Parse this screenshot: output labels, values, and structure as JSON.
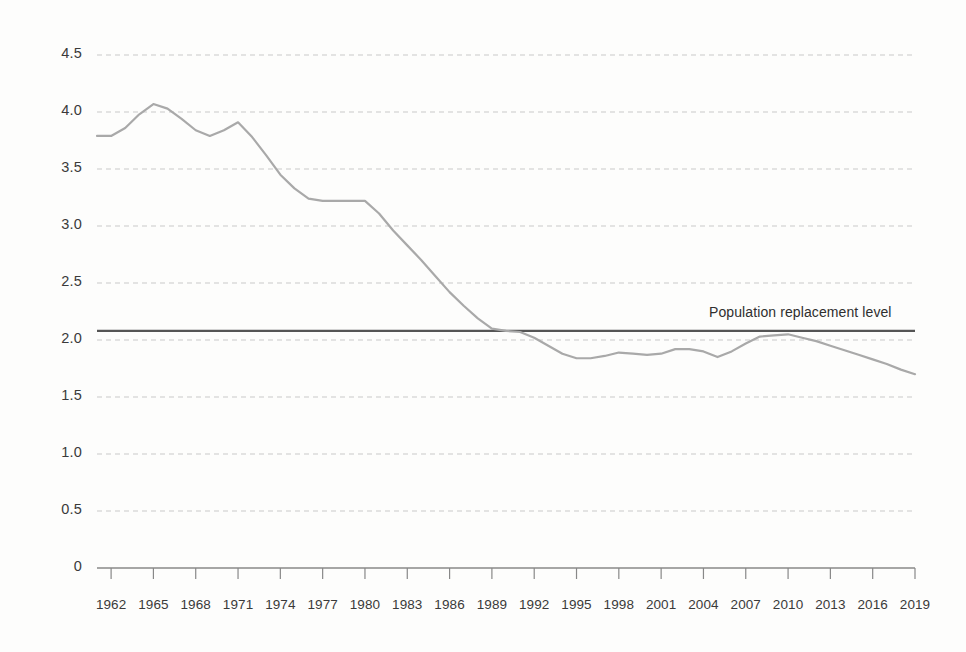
{
  "chart_data": {
    "type": "line",
    "title": "",
    "subtitle": "",
    "xlabel": "",
    "ylabel": "",
    "xlim": [
      1961,
      2019
    ],
    "ylim": [
      0,
      4.5
    ],
    "grid": "horizontal-dashed",
    "legend": "none",
    "y_ticks": [
      "4.5",
      "4.0",
      "3.5",
      "3.0",
      "2.5",
      "2.0",
      "1.5",
      "1.0",
      "0.5",
      "0"
    ],
    "y_tick_values": [
      4.5,
      4.0,
      3.5,
      3.0,
      2.5,
      2.0,
      1.5,
      1.0,
      0.5,
      0
    ],
    "x_ticks": [
      "1962",
      "1965",
      "1968",
      "1971",
      "1974",
      "1977",
      "1980",
      "1983",
      "1986",
      "1989",
      "1992",
      "1995",
      "1998",
      "2001",
      "2004",
      "2007",
      "2010",
      "2013",
      "2016",
      "2019"
    ],
    "x_tick_values": [
      1962,
      1965,
      1968,
      1971,
      1974,
      1977,
      1980,
      1983,
      1986,
      1989,
      1992,
      1995,
      1998,
      2001,
      2004,
      2007,
      2010,
      2013,
      2016,
      2019
    ],
    "series": [
      {
        "name": "Fertility rate",
        "color": "#a9a9a9",
        "x": [
          1961,
          1962,
          1963,
          1964,
          1965,
          1966,
          1967,
          1968,
          1969,
          1970,
          1971,
          1972,
          1973,
          1974,
          1975,
          1976,
          1977,
          1978,
          1979,
          1980,
          1981,
          1982,
          1983,
          1984,
          1985,
          1986,
          1987,
          1988,
          1989,
          1990,
          1991,
          1992,
          1993,
          1994,
          1995,
          1996,
          1997,
          1998,
          1999,
          2000,
          2001,
          2002,
          2003,
          2004,
          2005,
          2006,
          2007,
          2008,
          2009,
          2010,
          2011,
          2012,
          2013,
          2014,
          2015,
          2016,
          2017,
          2018,
          2019
        ],
        "values": [
          3.79,
          3.79,
          3.86,
          3.98,
          4.07,
          4.03,
          3.94,
          3.84,
          3.79,
          3.84,
          3.91,
          3.78,
          3.62,
          3.45,
          3.33,
          3.24,
          3.22,
          3.22,
          3.22,
          3.22,
          3.11,
          2.96,
          2.83,
          2.7,
          2.56,
          2.42,
          2.3,
          2.19,
          2.1,
          2.08,
          2.07,
          2.02,
          1.95,
          1.88,
          1.84,
          1.84,
          1.86,
          1.89,
          1.88,
          1.87,
          1.88,
          1.92,
          1.92,
          1.9,
          1.85,
          1.9,
          1.97,
          2.03,
          2.04,
          2.05,
          2.02,
          1.99,
          1.95,
          1.91,
          1.87,
          1.83,
          1.79,
          1.74,
          1.7
        ]
      }
    ],
    "reference_line": {
      "label": "Population replacement level",
      "value": 2.08,
      "color": "#555555"
    }
  },
  "axis": {
    "baseline_color": "#888888",
    "grid_color": "#c9c9c9"
  }
}
